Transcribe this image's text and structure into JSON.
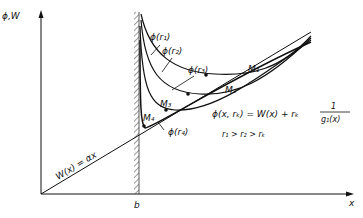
{
  "axes": {
    "y_label": "ϕ,W",
    "x_label": "x",
    "wall_label": "b"
  },
  "line": {
    "label": "W(x) = αx"
  },
  "curves": [
    {
      "label": "ϕ(r₁)",
      "min_label": "M₁"
    },
    {
      "label": "ϕ(r₂)",
      "min_label": "M₂"
    },
    {
      "label": "ϕ(r₃)",
      "min_label": "M₃"
    },
    {
      "label": "ϕ(r₄)",
      "min_label": "M₄"
    }
  ],
  "equation": {
    "lhs": "ϕ(x, rₖ) = W(x) + rₖ",
    "numerator": "1",
    "denominator": "g₁(x)",
    "inequality": "r₁ > r₂ > rₖ"
  }
}
